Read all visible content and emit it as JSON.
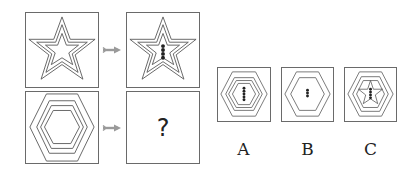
{
  "puzzle": {
    "row1": {
      "left": "star-3-nested",
      "right": "star-3-nested-with-4-dots"
    },
    "row2": {
      "left": "hexagon-4-nested",
      "right": "?"
    },
    "question_mark": "?"
  },
  "options": [
    {
      "label": "A",
      "figure": "hexagon-4-nested-with-5-dots"
    },
    {
      "label": "B",
      "figure": "hexagon-2-nested-with-3-dots"
    },
    {
      "label": "C",
      "figure": "hexagon-3-nested-with-star-and-4-dots"
    }
  ],
  "colors": {
    "line": "#555555",
    "arrow": "#9a9a9a",
    "dot": "#222222"
  }
}
